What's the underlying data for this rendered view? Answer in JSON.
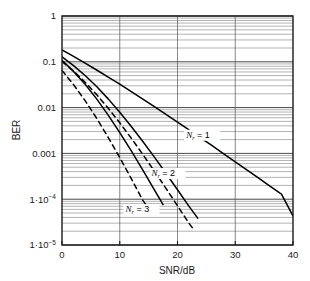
{
  "chart_data": {
    "type": "line",
    "title": "",
    "xlabel": "SNR/dB",
    "ylabel": "BER",
    "xlim": [
      0,
      40
    ],
    "ylim": [
      1e-05,
      1
    ],
    "yscale": "log",
    "xscale": "linear",
    "grid": true,
    "grid_minor": true,
    "legend_position": "inline-annotations",
    "xticks": [
      0,
      10,
      20,
      30,
      40
    ],
    "xtick_labels": [
      "0",
      "10",
      "20",
      "30",
      "40"
    ],
    "yticks": [
      1,
      0.1,
      0.01,
      0.001,
      0.0001,
      1e-05
    ],
    "ytick_labels": [
      "1",
      "0.1",
      "0.01",
      "0.001",
      "1.10-4",
      "1.10-5"
    ],
    "annotations": [
      {
        "text_base": "N",
        "text_sub": "r",
        "text_rest": " = 1",
        "x": 21.5,
        "y": 0.0022
      },
      {
        "text_base": "N",
        "text_sub": "r",
        "text_rest": " = 2",
        "x": 15.5,
        "y": 0.00032
      },
      {
        "text_base": "N",
        "text_sub": "r",
        "text_rest": " = 3",
        "x": 11.0,
        "y": 5.2e-05
      }
    ],
    "series": [
      {
        "name": "Nr = 1 (solid)",
        "style": "solid",
        "color": "#000000",
        "x": [
          0,
          2,
          4,
          6,
          8,
          10,
          12,
          14,
          16,
          18,
          20,
          22,
          24,
          26,
          28,
          30,
          32,
          34,
          36,
          38,
          40
        ],
        "y": [
          0.181,
          0.131,
          0.0935,
          0.0662,
          0.0465,
          0.0324,
          0.0224,
          0.0154,
          0.0105,
          0.00715,
          0.00483,
          0.00326,
          0.00219,
          0.00147,
          0.000982,
          0.000656,
          0.000437,
          0.000291,
          0.000194,
          0.000129,
          4.34e-05
        ]
      },
      {
        "name": "Nr = 2 (solid)",
        "style": "solid",
        "color": "#000000",
        "x": [
          0,
          2,
          4,
          6,
          8,
          10,
          12,
          14,
          16,
          18,
          20,
          22,
          23.5
        ],
        "y": [
          0.128,
          0.0826,
          0.0503,
          0.0288,
          0.0155,
          0.00793,
          0.00387,
          0.00182,
          0.000828,
          0.000368,
          0.000161,
          6.97e-05,
          3.86e-05
        ]
      },
      {
        "name": "Nr = 3 (solid)",
        "style": "solid",
        "color": "#000000",
        "x": [
          0,
          2,
          4,
          6,
          8,
          10,
          12,
          14,
          16,
          17.5
        ],
        "y": [
          0.108,
          0.0617,
          0.0323,
          0.0155,
          0.00686,
          0.00285,
          0.00113,
          0.000431,
          0.000159,
          7.62e-05
        ]
      },
      {
        "name": "Nr = 2 (dashed)",
        "style": "dashed",
        "color": "#000000",
        "x": [
          0,
          2,
          4,
          6,
          8,
          10,
          12,
          14,
          16,
          18,
          20,
          22,
          22.8
        ],
        "y": [
          0.102,
          0.0624,
          0.0358,
          0.0192,
          0.00971,
          0.00466,
          0.00214,
          0.000949,
          0.000409,
          0.000173,
          7.19e-05,
          2.96e-05,
          2.18e-05
        ]
      },
      {
        "name": "Nr = 3 (dashed)",
        "style": "dashed",
        "color": "#000000",
        "x": [
          0,
          2,
          4,
          6,
          8,
          10,
          12,
          14,
          15.4
        ],
        "y": [
          0.0648,
          0.0317,
          0.0142,
          0.00584,
          0.00224,
          0.000811,
          0.000281,
          9.41e-05,
          5.27e-05
        ]
      }
    ]
  },
  "axes": {
    "y_label": "BER",
    "x_label": "SNR/dB"
  }
}
